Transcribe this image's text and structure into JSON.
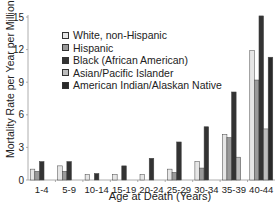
{
  "chart_data": {
    "type": "bar",
    "title": "",
    "xlabel": "Age at Death (Years)",
    "ylabel": "Mortality Rate per Year per Million",
    "ylim": [
      0,
      15
    ],
    "yticks": [
      0,
      3,
      6,
      9,
      12,
      15
    ],
    "grid": false,
    "legend_position": "upper left",
    "categories": [
      "1-4",
      "5-9",
      "10-14",
      "15-19",
      "20-24",
      "25-29",
      "30-34",
      "35-39",
      "40-44"
    ],
    "series": [
      {
        "name": "White, non-Hispanic",
        "color": "#e6e6e6",
        "values": [
          1.0,
          1.3,
          0.5,
          0.5,
          0.5,
          1.0,
          1.7,
          4.2,
          11.9
        ]
      },
      {
        "name": "Hispanic",
        "color": "#9a9a9a",
        "values": [
          0.8,
          0.8,
          0,
          0,
          0,
          0.7,
          1.1,
          3.9,
          9.2
        ]
      },
      {
        "name": "Black (African American)",
        "color": "#333333",
        "values": [
          1.7,
          1.7,
          0.6,
          1.3,
          2.0,
          3.5,
          4.9,
          8.1,
          15.1
        ]
      },
      {
        "name": "Asian/Pacific Islander",
        "color": "#bdbdbd",
        "values": [
          0,
          0,
          0,
          0,
          0,
          0,
          0,
          2.1,
          4.7
        ]
      },
      {
        "name": "American Indian/Alaskan Native",
        "color": "#2a2a2a",
        "values": [
          0,
          0,
          0,
          0,
          0,
          0,
          0,
          0,
          11.3
        ]
      }
    ]
  },
  "labels": {
    "ylabel": "Mortality Rate per Year per Million",
    "xlabel": "Age at Death (Years)"
  },
  "legend": [
    {
      "label": "White, non-Hispanic",
      "color": "#e6e6e6"
    },
    {
      "label": "Hispanic",
      "color": "#9a9a9a"
    },
    {
      "label": "Black (African American)",
      "color": "#333333"
    },
    {
      "label": "Asian/Pacific Islander",
      "color": "#bdbdbd"
    },
    {
      "label": "American Indian/Alaskan Native",
      "color": "#2a2a2a"
    }
  ]
}
